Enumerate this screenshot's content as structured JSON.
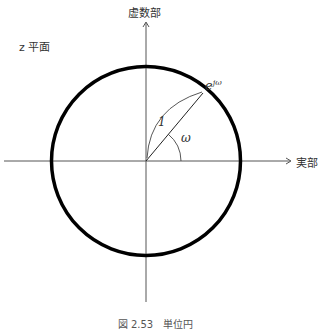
{
  "diagram": {
    "plane_label": "z 平面",
    "imag_axis_label": "虚数部",
    "real_axis_label": "実部",
    "point_label": "e",
    "point_label_sup": "jω",
    "radius_label": "1",
    "angle_label": "ω",
    "caption": "図 2.53　単位円"
  },
  "colors": {
    "circle": "#000000",
    "axes": "#555555",
    "text": "#333333"
  },
  "geometry": {
    "center": [
      146,
      161
    ],
    "radius": 95,
    "angle_deg": 50
  }
}
